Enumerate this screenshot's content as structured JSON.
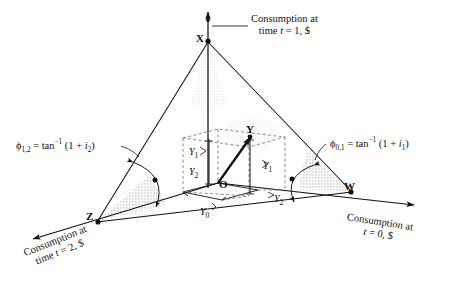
{
  "figure": {
    "type": "3d-geometric-diagram",
    "background_color": "#ffffff",
    "line_color": "#111111",
    "shade_color": "#b9b9b9"
  },
  "vertices": [
    {
      "id": "X",
      "label": "X",
      "x": 208,
      "y": 38,
      "role": "apex-time-1"
    },
    {
      "id": "Z",
      "label": "Z",
      "x": 96,
      "y": 223,
      "role": "left-time-2"
    },
    {
      "id": "W",
      "label": "W",
      "x": 353,
      "y": 193,
      "role": "right-time-0"
    },
    {
      "id": "O",
      "label": "O",
      "x": 218,
      "y": 182,
      "role": "origin"
    },
    {
      "id": "Y",
      "label": "Y",
      "x": 249,
      "y": 131,
      "role": "endowment-point"
    }
  ],
  "axis_labels": {
    "time1": {
      "line1": "Consumption at",
      "line2_pre": "time ",
      "line2_var": "t",
      "line2_post": " = 1, $"
    },
    "time0": {
      "line1": "Consumption at",
      "line2_pre": "",
      "line2_var": "t",
      "line2_post": " = 0, $"
    },
    "time2": {
      "line1": "Consumption at",
      "line2_pre": "time ",
      "line2_var": "t",
      "line2_post": " = 2, $"
    }
  },
  "formulas": {
    "left": {
      "phi": "ϕ",
      "phi_sub": "1,2",
      "eq": " = tan",
      "sup": "−1",
      "arg_pre": " (1 + ",
      "arg_var": "i",
      "arg_sub": "2",
      "arg_post": ")"
    },
    "right": {
      "phi": "ϕ",
      "phi_sub": "0,1",
      "eq": " = tan",
      "sup": "−1",
      "arg_pre": " (1 + ",
      "arg_var": "i",
      "arg_sub": "1",
      "arg_post": ")"
    }
  },
  "segment_labels": [
    {
      "name": "Y1-left",
      "var": "Y",
      "sub": "1",
      "x": 191,
      "y": 152
    },
    {
      "name": "Y2-left",
      "var": "Y",
      "sub": "2",
      "x": 191,
      "y": 172
    },
    {
      "name": "Y1-right",
      "var": "Y",
      "sub": "1",
      "x": 266,
      "y": 166
    },
    {
      "name": "Y0-base",
      "var": "Y",
      "sub": "0",
      "x": 203,
      "y": 208
    },
    {
      "name": "Y2-base",
      "var": "Y",
      "sub": "2",
      "x": 275,
      "y": 198
    }
  ],
  "angle_arcs": [
    {
      "name": "angle-arc-left",
      "at_vertex": "Z",
      "annotates": "phi_1_2"
    },
    {
      "name": "angle-arc-right",
      "at_vertex": "W",
      "annotates": "phi_0_1"
    }
  ]
}
